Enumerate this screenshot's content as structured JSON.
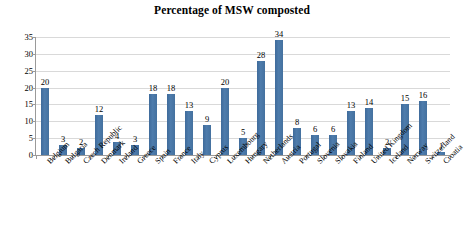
{
  "chart_data": {
    "type": "bar",
    "title": "Percentage of MSW composted",
    "xlabel": "",
    "ylabel": "",
    "ylim": [
      0,
      35
    ],
    "yticks": [
      0,
      5,
      10,
      15,
      20,
      25,
      30,
      35
    ],
    "grid": true,
    "legend": false,
    "series_color": "#4874a4",
    "categories": [
      "Belgium",
      "Bulgaria",
      "Czech Republic",
      "Denmark",
      "Ireland",
      "Greece",
      "Spain",
      "France",
      "Italy",
      "Cyprus",
      "Luxembourg",
      "Hungary",
      "Netherlands",
      "Austria",
      "Portugal",
      "Slovenia",
      "Slovakia",
      "Finland",
      "United Kingdom",
      "Iceland",
      "Norway",
      "Switzerland",
      "Croatia"
    ],
    "values": [
      20,
      3,
      2,
      12,
      4,
      3,
      18,
      18,
      13,
      9,
      20,
      5,
      28,
      34,
      8,
      6,
      6,
      13,
      14,
      2,
      15,
      16,
      1
    ],
    "data_labels": [
      "20",
      "3",
      "2",
      "12",
      "4",
      "3",
      "18",
      "18",
      "13",
      "9",
      "20",
      "5",
      "28",
      "34",
      "8",
      "6",
      "6",
      "13",
      "14",
      "2",
      "15",
      "16",
      "1"
    ]
  }
}
